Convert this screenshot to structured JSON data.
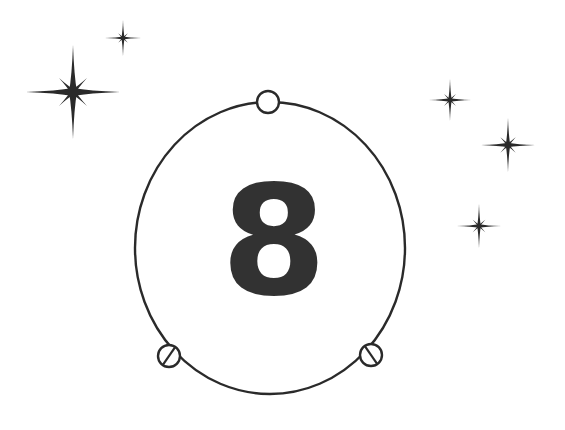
{
  "figure": {
    "type": "atomic-orbital-diagram",
    "background_color": "#ffffff",
    "ink_color": "#2b2b2b",
    "nucleus": {
      "label": "8",
      "fill_color": "#333333",
      "center_x": 274,
      "center_y": 252,
      "font_size": 152
    },
    "orbit": {
      "center_x": 270,
      "center_y": 248,
      "radius_x": 135,
      "radius_y": 146,
      "stroke_color": "#2b2b2b",
      "stroke_width": 2.4
    },
    "electrons": [
      {
        "name": "electron-top",
        "cx": 268,
        "cy": 102,
        "r": 11,
        "slash": false
      },
      {
        "name": "electron-bottom-left",
        "cx": 169,
        "cy": 356,
        "r": 11,
        "slash": true
      },
      {
        "name": "electron-bottom-right",
        "cx": 371,
        "cy": 355,
        "r": 11,
        "slash": true
      }
    ],
    "electron_count": 3,
    "stars": [
      {
        "name": "star-large-upper-left",
        "cx": 73,
        "cy": 92,
        "size": 47,
        "minor": 0.42
      },
      {
        "name": "star-small-top",
        "cx": 123,
        "cy": 38,
        "size": 18,
        "minor": 0.38
      },
      {
        "name": "star-right-upper",
        "cx": 450,
        "cy": 100,
        "size": 21,
        "minor": 0.4
      },
      {
        "name": "star-right-middle",
        "cx": 508,
        "cy": 145,
        "size": 27,
        "minor": 0.4
      },
      {
        "name": "star-right-lower",
        "cx": 479,
        "cy": 226,
        "size": 22,
        "minor": 0.4
      }
    ],
    "star_count": 5
  }
}
